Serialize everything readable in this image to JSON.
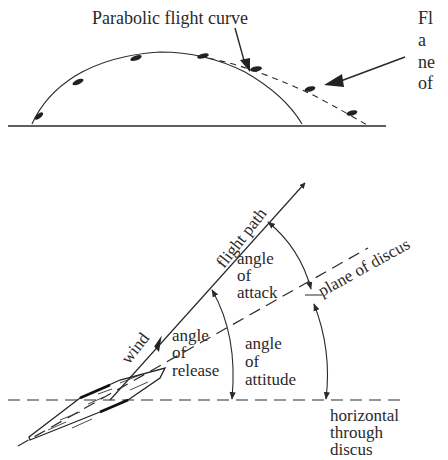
{
  "top_panel": {
    "title": "Parabolic flight curve",
    "cut_off_text": [
      "Fl",
      "a",
      "ne",
      "of"
    ]
  },
  "bottom_panel": {
    "flight_path": "flight path",
    "plane_of_discus": "plane of discus",
    "wind": "wind",
    "angle_of_attack": [
      "angle",
      "of",
      "attack"
    ],
    "angle_of_release": [
      "angle",
      "of",
      "release"
    ],
    "angle_of_attitude": [
      "angle",
      "of",
      "attitude"
    ],
    "horizontal_through_discus": [
      "horizontal",
      "through",
      "discus"
    ]
  }
}
